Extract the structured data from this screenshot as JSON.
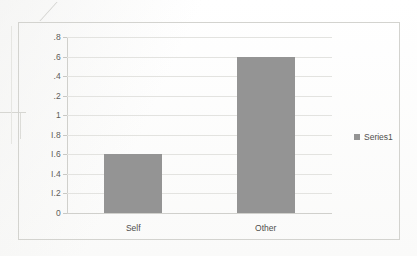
{
  "chart_data": {
    "type": "bar",
    "title": "",
    "xlabel": "",
    "ylabel": "",
    "categories": [
      "Self",
      "Other"
    ],
    "values": [
      0.6,
      1.6
    ],
    "series": [
      {
        "name": "Series1",
        "values": [
          0.6,
          1.6
        ]
      }
    ],
    "ylim": [
      0,
      1.8
    ],
    "ytick_values": [
      1.8,
      1.6,
      1.4,
      1.2,
      1.0,
      0.8,
      0.6,
      0.4,
      0.2,
      0
    ],
    "ytick_labels": [
      ".8",
      ".6",
      ".4",
      ".2",
      "1",
      "I.8",
      "I.6",
      "I.4",
      "I.2",
      "0"
    ],
    "grid": true,
    "legend_position": "right",
    "bar_color": "#949494",
    "note": "Y tick labels are clipped on their left edge by the scanned page crop; the underlying values are 1.8, 1.6, 1.4, 1.2, 1, 0.8, 0.6, 0.4, 0.2, 0."
  },
  "legend": {
    "entries": [
      {
        "label": "Series1",
        "color": "#949494",
        "marker": "square-marker"
      }
    ]
  }
}
